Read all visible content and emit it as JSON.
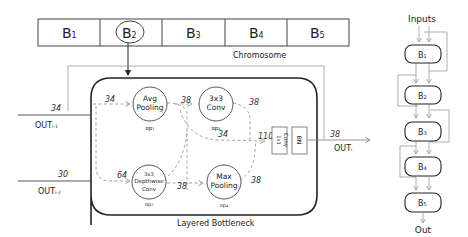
{
  "chromosome": {
    "label": "Chromosome",
    "cells": [
      {
        "main": "B",
        "sub": "1",
        "selected": false
      },
      {
        "main": "B",
        "sub": "2",
        "selected": true
      },
      {
        "main": "B",
        "sub": "3",
        "selected": false
      },
      {
        "main": "B",
        "sub": "4",
        "selected": false
      },
      {
        "main": "B",
        "sub": "5",
        "selected": false
      }
    ]
  },
  "bottleneck": {
    "label": "Layered Bottleneck",
    "inputs": [
      {
        "label": "OUT",
        "sub": "i-1",
        "channels": "34"
      },
      {
        "label": "OUT",
        "sub": "i-2",
        "channels": "30"
      }
    ],
    "ops": [
      {
        "id": "op1",
        "lines": [
          "Avg",
          "Pooling"
        ],
        "label": "op",
        "sub": "1"
      },
      {
        "id": "op3",
        "lines": [
          "3x3",
          "Conv"
        ],
        "label": "op",
        "sub": "3"
      },
      {
        "id": "op2",
        "lines": [
          "3x3",
          "Depthwise",
          "Conv"
        ],
        "label": "op",
        "sub": "2"
      },
      {
        "id": "op4",
        "lines": [
          "Max",
          "Pooling"
        ],
        "label": "op",
        "sub": "4"
      }
    ],
    "edge_labels": {
      "in1_to_op1": "34",
      "op1_to_op3": "38",
      "op3_out": "38",
      "skip_to_concat": "34",
      "concat_in": "110",
      "in2_to_op2": "64",
      "op2_to_op4": "38",
      "op4_out": "38"
    },
    "conv1x1": {
      "label_a": "1x1",
      "label_b": "Conv"
    },
    "bn": {
      "label": "BN"
    },
    "output": {
      "label": "OUT",
      "sub": "i",
      "channels": "38"
    }
  },
  "network": {
    "top_label": "Inputs",
    "bottom_label": "Out",
    "blocks": [
      {
        "main": "B",
        "sub": "1"
      },
      {
        "main": "B",
        "sub": "2"
      },
      {
        "main": "B",
        "sub": "3"
      },
      {
        "main": "B",
        "sub": "4"
      },
      {
        "main": "B",
        "sub": "5"
      }
    ]
  },
  "colors": {
    "line": "#222222",
    "dashed": "#9a9a9a",
    "thin": "#9a9a9a"
  }
}
